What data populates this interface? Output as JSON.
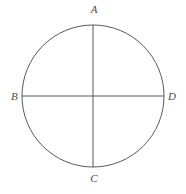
{
  "figure": {
    "kind": "geometry-diagram",
    "background_color": "#ffffff",
    "stroke_color": "#595959",
    "label_color": "#4a4a4a",
    "stroke_width": 1,
    "width": 186,
    "height": 194
  },
  "circle": {
    "center_x": 93,
    "center_y": 96,
    "radius": 71
  },
  "diameters": [
    {
      "name": "vertical-diameter-AC",
      "from": "A",
      "to": "C",
      "x1": 93,
      "y1": 25,
      "x2": 93,
      "y2": 167
    },
    {
      "name": "horizontal-diameter-BD",
      "from": "B",
      "to": "D",
      "x1": 22,
      "y1": 96,
      "x2": 164,
      "y2": 96
    }
  ],
  "labels": {
    "top": "A",
    "left": "B",
    "bottom": "C",
    "right": "D"
  },
  "chart_data": {
    "type": "scatter",
    "title": "",
    "xlabel": "",
    "ylabel": "",
    "annotations": [
      "A",
      "B",
      "C",
      "D"
    ],
    "points": [
      {
        "label": "A",
        "x": 93,
        "y": 25,
        "position": "top"
      },
      {
        "label": "B",
        "x": 22,
        "y": 96,
        "position": "left"
      },
      {
        "label": "C",
        "x": 93,
        "y": 167,
        "position": "bottom"
      },
      {
        "label": "D",
        "x": 164,
        "y": 96,
        "position": "right"
      }
    ]
  }
}
